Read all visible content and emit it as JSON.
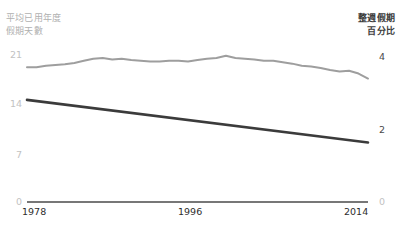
{
  "chart_data": {
    "type": "line",
    "title": "",
    "left_axis": {
      "label_lines": [
        "平均已用年度",
        "假期天數"
      ],
      "ticks": [
        "21",
        "14",
        "7",
        "0"
      ],
      "ylim": [
        0,
        21
      ]
    },
    "right_axis": {
      "label_lines": [
        "整週假期",
        "百分比"
      ],
      "ticks": [
        "4",
        "2",
        "0"
      ],
      "ylim": [
        0,
        4
      ]
    },
    "xlabel": "",
    "xticks": [
      "1978",
      "1996",
      "2014"
    ],
    "xlim": [
      1978,
      2014
    ],
    "grid": false,
    "legend": "none",
    "series": [
      {
        "name": "平均已用年度假期天數",
        "axis": "left",
        "color": "#9e9e9e",
        "x": [
          1978,
          1979,
          1980,
          1981,
          1982,
          1983,
          1984,
          1985,
          1986,
          1987,
          1988,
          1989,
          1990,
          1991,
          1992,
          1993,
          1994,
          1995,
          1996,
          1997,
          1998,
          1999,
          2000,
          2001,
          2002,
          2003,
          2004,
          2005,
          2006,
          2007,
          2008,
          2009,
          2010,
          2011,
          2012,
          2013,
          2014
        ],
        "values": [
          19.0,
          19.0,
          19.2,
          19.3,
          19.4,
          19.6,
          19.9,
          20.2,
          20.3,
          20.1,
          20.2,
          20.0,
          19.9,
          19.8,
          19.8,
          19.9,
          19.9,
          19.8,
          20.0,
          20.2,
          20.3,
          20.6,
          20.3,
          20.2,
          20.1,
          19.9,
          19.9,
          19.7,
          19.5,
          19.2,
          19.1,
          18.9,
          18.6,
          18.4,
          18.5,
          18.1,
          17.4
        ]
      },
      {
        "name": "整週假期百分比",
        "axis": "right",
        "color": "#3b3b3b",
        "x": [
          1978,
          2014
        ],
        "values": [
          2.78,
          1.62
        ]
      }
    ]
  },
  "axes": {
    "left_title_line1": "平均已用年度",
    "left_title_line2": "假期天數",
    "right_title_line1": "整週假期",
    "right_title_line2": "百分比",
    "left_tick_21": "21",
    "left_tick_14": "14",
    "left_tick_7": "7",
    "left_tick_0": "0",
    "right_tick_4": "4",
    "right_tick_2": "2",
    "right_tick_0": "0",
    "x_start": "1978",
    "x_mid": "1996",
    "x_end": "2014"
  },
  "colors": {
    "series_gray": "#9e9e9e",
    "series_dark": "#3b3b3b",
    "axis": "#4a4a4a",
    "muted_text": "#c2c2c2",
    "dark_text": "#2e2e2e"
  }
}
